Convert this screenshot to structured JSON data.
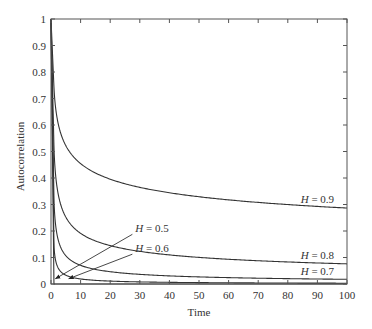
{
  "chart_data": {
    "type": "line",
    "title": "",
    "xlabel": "Time",
    "ylabel": "Autocorrelation",
    "xlim": [
      0,
      100
    ],
    "ylim": [
      0,
      1
    ],
    "xticks": [
      0,
      10,
      20,
      30,
      40,
      50,
      60,
      70,
      80,
      90,
      100
    ],
    "yticks": [
      0,
      0.1,
      0.2,
      0.3,
      0.4,
      0.5,
      0.6,
      0.7,
      0.8,
      0.9,
      1
    ],
    "ytick_labels": [
      "0",
      "0.1",
      "0.2",
      "0.3",
      "0.4",
      "0.5",
      "0.6",
      "0.7",
      "0.8",
      "0.9",
      "1"
    ],
    "grid": false,
    "legend": "inline annotations",
    "series": [
      {
        "name": "H = 0.5",
        "H": 0.5,
        "x": [
          0,
          1,
          2,
          5,
          10,
          20,
          50,
          100
        ],
        "values": [
          1.0,
          0.0,
          0.0,
          0.0,
          0.0,
          0.0,
          0.0,
          0.0
        ]
      },
      {
        "name": "H = 0.6",
        "H": 0.6,
        "x": [
          0,
          1,
          2,
          5,
          10,
          20,
          50,
          100
        ],
        "values": [
          1.0,
          0.149,
          0.08,
          0.045,
          0.03,
          0.019,
          0.01,
          0.006
        ]
      },
      {
        "name": "H = 0.7",
        "H": 0.7,
        "x": [
          0,
          1,
          2,
          5,
          10,
          20,
          50,
          100
        ],
        "values": [
          1.0,
          0.32,
          0.195,
          0.106,
          0.07,
          0.046,
          0.027,
          0.018
        ]
      },
      {
        "name": "H = 0.8",
        "H": 0.8,
        "x": [
          0,
          1,
          2,
          5,
          10,
          20,
          50,
          100
        ],
        "values": [
          1.0,
          0.516,
          0.363,
          0.243,
          0.191,
          0.145,
          0.1,
          0.076
        ]
      },
      {
        "name": "H = 0.9",
        "H": 0.9,
        "x": [
          0,
          1,
          2,
          5,
          10,
          20,
          50,
          100
        ],
        "values": [
          1.0,
          0.741,
          0.601,
          0.498,
          0.433,
          0.377,
          0.316,
          0.287
        ]
      }
    ],
    "annotations": [
      {
        "text_prefix": "H",
        "text_suffix": " = 0.9",
        "x": 90,
        "y": 0.305
      },
      {
        "text_prefix": "H",
        "text_suffix": " = 0.8",
        "x": 90,
        "y": 0.093
      },
      {
        "text_prefix": "H",
        "text_suffix": " = 0.7",
        "x": 90,
        "y": 0.035
      },
      {
        "text_prefix": "H",
        "text_suffix": " = 0.5",
        "x": 28.5,
        "y": 0.195,
        "arrow_to": [
          1.5,
          0.02
        ]
      },
      {
        "text_prefix": "H",
        "text_suffix": " = 0.6",
        "x": 28.5,
        "y": 0.12,
        "arrow_to": [
          6,
          0.02
        ]
      }
    ]
  }
}
